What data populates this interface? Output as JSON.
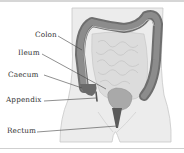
{
  "figure": {
    "type": "anatomical-diagram",
    "labels": [
      {
        "id": "colon",
        "text": "Colon"
      },
      {
        "id": "ileum",
        "text": "Ileum"
      },
      {
        "id": "caecum",
        "text": "Caecum"
      },
      {
        "id": "appendix",
        "text": "Appendix"
      },
      {
        "id": "rectum",
        "text": "Rectum"
      }
    ]
  },
  "colors": {
    "body": "#ececec",
    "body_outline": "#c8c8c8",
    "colon": "#7a7a7a",
    "colon_dark": "#5e5e5e",
    "small_intestine": "#dcdcdc",
    "rectum": "#5a5a5a",
    "leader_line": "#444444",
    "rule": "#d6d6d6"
  }
}
